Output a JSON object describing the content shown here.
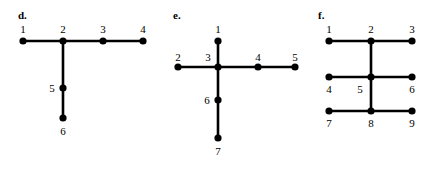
{
  "page": {
    "background_color": "#ffffff",
    "ink_color": "#000000"
  },
  "figures": [
    {
      "id": "figure-d",
      "letter": "d.",
      "letter_pos": {
        "x": 18,
        "y": 10
      },
      "node_radius": 3.6,
      "edge_width": 2.6,
      "nodes": [
        {
          "id": "1",
          "label": "1",
          "x": 23,
          "y": 41,
          "label_x": 23,
          "label_y": 24,
          "label_anchor": "above"
        },
        {
          "id": "2",
          "label": "2",
          "x": 63,
          "y": 41,
          "label_x": 63,
          "label_y": 24,
          "label_anchor": "above"
        },
        {
          "id": "3",
          "label": "3",
          "x": 103,
          "y": 41,
          "label_x": 103,
          "label_y": 24,
          "label_anchor": "above"
        },
        {
          "id": "4",
          "label": "4",
          "x": 143,
          "y": 41,
          "label_x": 143,
          "label_y": 24,
          "label_anchor": "above"
        },
        {
          "id": "5",
          "label": "5",
          "x": 63,
          "y": 88,
          "label_x": 52,
          "label_y": 83,
          "label_anchor": "left"
        },
        {
          "id": "6",
          "label": "6",
          "x": 63,
          "y": 118,
          "label_x": 63,
          "label_y": 126,
          "label_anchor": "below"
        }
      ],
      "edges": [
        {
          "from": "1",
          "to": "2"
        },
        {
          "from": "2",
          "to": "3"
        },
        {
          "from": "3",
          "to": "4"
        },
        {
          "from": "2",
          "to": "5"
        },
        {
          "from": "5",
          "to": "6"
        }
      ]
    },
    {
      "id": "figure-e",
      "letter": "e.",
      "letter_pos": {
        "x": 173,
        "y": 10
      },
      "node_radius": 3.6,
      "edge_width": 2.6,
      "nodes": [
        {
          "id": "1",
          "label": "1",
          "x": 218,
          "y": 41,
          "label_x": 218,
          "label_y": 24,
          "label_anchor": "above"
        },
        {
          "id": "2",
          "label": "2",
          "x": 178,
          "y": 67,
          "label_x": 178,
          "label_y": 52,
          "label_anchor": "above"
        },
        {
          "id": "3",
          "label": "3",
          "x": 218,
          "y": 67,
          "label_x": 208,
          "label_y": 52,
          "label_anchor": "above"
        },
        {
          "id": "4",
          "label": "4",
          "x": 258,
          "y": 67,
          "label_x": 258,
          "label_y": 52,
          "label_anchor": "above"
        },
        {
          "id": "5",
          "label": "5",
          "x": 295,
          "y": 67,
          "label_x": 295,
          "label_y": 52,
          "label_anchor": "above"
        },
        {
          "id": "6",
          "label": "6",
          "x": 218,
          "y": 100,
          "label_x": 207,
          "label_y": 95,
          "label_anchor": "left"
        },
        {
          "id": "7",
          "label": "7",
          "x": 218,
          "y": 138,
          "label_x": 218,
          "label_y": 146,
          "label_anchor": "below"
        }
      ],
      "edges": [
        {
          "from": "1",
          "to": "3"
        },
        {
          "from": "2",
          "to": "3"
        },
        {
          "from": "3",
          "to": "4"
        },
        {
          "from": "4",
          "to": "5"
        },
        {
          "from": "3",
          "to": "6"
        },
        {
          "from": "6",
          "to": "7"
        }
      ]
    },
    {
      "id": "figure-f",
      "letter": "f.",
      "letter_pos": {
        "x": 318,
        "y": 10
      },
      "node_radius": 3.6,
      "edge_width": 2.6,
      "nodes": [
        {
          "id": "1",
          "label": "1",
          "x": 329,
          "y": 41,
          "label_x": 329,
          "label_y": 24,
          "label_anchor": "above"
        },
        {
          "id": "2",
          "label": "2",
          "x": 371,
          "y": 41,
          "label_x": 371,
          "label_y": 24,
          "label_anchor": "above"
        },
        {
          "id": "3",
          "label": "3",
          "x": 412,
          "y": 41,
          "label_x": 412,
          "label_y": 24,
          "label_anchor": "above"
        },
        {
          "id": "4",
          "label": "4",
          "x": 329,
          "y": 77,
          "label_x": 329,
          "label_y": 84,
          "label_anchor": "below"
        },
        {
          "id": "5",
          "label": "5",
          "x": 371,
          "y": 77,
          "label_x": 360,
          "label_y": 84,
          "label_anchor": "below"
        },
        {
          "id": "6",
          "label": "6",
          "x": 412,
          "y": 77,
          "label_x": 412,
          "label_y": 84,
          "label_anchor": "below"
        },
        {
          "id": "7",
          "label": "7",
          "x": 329,
          "y": 111,
          "label_x": 329,
          "label_y": 118,
          "label_anchor": "below"
        },
        {
          "id": "8",
          "label": "8",
          "x": 371,
          "y": 111,
          "label_x": 371,
          "label_y": 118,
          "label_anchor": "below"
        },
        {
          "id": "9",
          "label": "9",
          "x": 412,
          "y": 111,
          "label_x": 412,
          "label_y": 118,
          "label_anchor": "below"
        }
      ],
      "edges": [
        {
          "from": "1",
          "to": "2"
        },
        {
          "from": "2",
          "to": "3"
        },
        {
          "from": "4",
          "to": "5"
        },
        {
          "from": "5",
          "to": "6"
        },
        {
          "from": "7",
          "to": "8"
        },
        {
          "from": "8",
          "to": "9"
        },
        {
          "from": "2",
          "to": "5"
        },
        {
          "from": "5",
          "to": "8"
        }
      ]
    }
  ]
}
